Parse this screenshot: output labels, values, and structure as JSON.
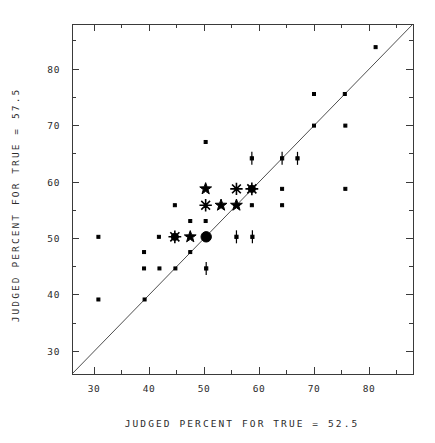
{
  "chart_data": {
    "type": "scatter",
    "title": "",
    "subtitle": "",
    "xlabel": "JUDGED PERCENT FOR TRUE = 52.5",
    "ylabel": "JUDGED PERCENT FOR TRUE = 57.5",
    "xlim": [
      26,
      88
    ],
    "ylim": [
      26,
      88
    ],
    "xticks": [
      30,
      40,
      50,
      60,
      70,
      80
    ],
    "yticks": [
      30,
      40,
      50,
      60,
      70,
      80
    ],
    "xtick_labels": [
      "30",
      "40",
      "50",
      "60",
      "70",
      "80"
    ],
    "ytick_labels": [
      "30",
      "40",
      "50",
      "60",
      "70",
      "80"
    ],
    "xminor_ticks": [
      35,
      45,
      55,
      65,
      75,
      85
    ],
    "yminor_ticks": [
      35,
      45,
      55,
      65,
      75,
      85
    ],
    "grid": false,
    "legend": null,
    "annotations": [],
    "reference_line": {
      "type": "identity",
      "label": "y = x",
      "from": [
        26,
        26
      ],
      "to": [
        88,
        88
      ]
    },
    "marker_kinds": {
      "dot": "small filled square point",
      "star": "five-pointed star",
      "asterisk": "eight-ray asterisk",
      "bigdot": "large filled circle",
      "dot-asterisk": "large filled circle with asterisk rays",
      "bar": "short vertical bar with center dot"
    },
    "points": [
      {
        "x": 30.8,
        "y": 50.3,
        "marker": "dot"
      },
      {
        "x": 30.8,
        "y": 39.2,
        "marker": "dot"
      },
      {
        "x": 39.1,
        "y": 47.6,
        "marker": "dot"
      },
      {
        "x": 39.1,
        "y": 44.7,
        "marker": "dot"
      },
      {
        "x": 39.2,
        "y": 39.2,
        "marker": "dot"
      },
      {
        "x": 41.8,
        "y": 50.3,
        "marker": "dot"
      },
      {
        "x": 41.9,
        "y": 44.7,
        "marker": "dot"
      },
      {
        "x": 44.7,
        "y": 55.9,
        "marker": "dot"
      },
      {
        "x": 44.7,
        "y": 50.3,
        "marker": "dot-asterisk"
      },
      {
        "x": 44.8,
        "y": 44.7,
        "marker": "dot"
      },
      {
        "x": 47.5,
        "y": 53.1,
        "marker": "dot"
      },
      {
        "x": 47.5,
        "y": 50.3,
        "marker": "star"
      },
      {
        "x": 47.5,
        "y": 47.6,
        "marker": "dot"
      },
      {
        "x": 50.3,
        "y": 67.1,
        "marker": "dot"
      },
      {
        "x": 50.3,
        "y": 58.8,
        "marker": "star"
      },
      {
        "x": 50.3,
        "y": 55.9,
        "marker": "asterisk"
      },
      {
        "x": 50.3,
        "y": 53.1,
        "marker": "dot"
      },
      {
        "x": 50.4,
        "y": 50.3,
        "marker": "bigdot"
      },
      {
        "x": 50.4,
        "y": 44.7,
        "marker": "bar"
      },
      {
        "x": 53.1,
        "y": 55.9,
        "marker": "star"
      },
      {
        "x": 55.9,
        "y": 58.8,
        "marker": "asterisk"
      },
      {
        "x": 55.9,
        "y": 55.9,
        "marker": "star"
      },
      {
        "x": 55.9,
        "y": 50.3,
        "marker": "bar"
      },
      {
        "x": 58.7,
        "y": 64.2,
        "marker": "bar"
      },
      {
        "x": 58.7,
        "y": 58.8,
        "marker": "dot-asterisk"
      },
      {
        "x": 58.7,
        "y": 55.9,
        "marker": "dot"
      },
      {
        "x": 58.8,
        "y": 50.3,
        "marker": "bar"
      },
      {
        "x": 64.2,
        "y": 64.2,
        "marker": "bar"
      },
      {
        "x": 64.2,
        "y": 58.8,
        "marker": "dot"
      },
      {
        "x": 64.2,
        "y": 55.9,
        "marker": "dot"
      },
      {
        "x": 67.0,
        "y": 64.2,
        "marker": "bar"
      },
      {
        "x": 70.0,
        "y": 75.6,
        "marker": "dot"
      },
      {
        "x": 70.0,
        "y": 70.0,
        "marker": "dot"
      },
      {
        "x": 75.6,
        "y": 75.6,
        "marker": "dot"
      },
      {
        "x": 75.7,
        "y": 70.0,
        "marker": "dot"
      },
      {
        "x": 75.7,
        "y": 58.8,
        "marker": "dot"
      },
      {
        "x": 81.2,
        "y": 83.9,
        "marker": "dot"
      }
    ]
  }
}
